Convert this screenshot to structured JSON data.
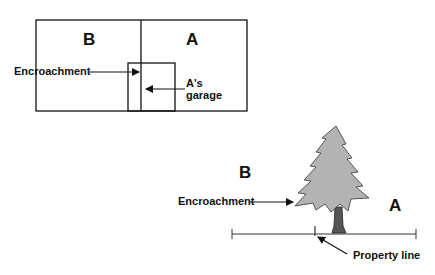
{
  "top_diagram": {
    "lot_b_label": "B",
    "lot_a_label": "A",
    "encroachment_label": "Encroachment",
    "garage_label_line1": "A's",
    "garage_label_line2": "garage"
  },
  "bottom_diagram": {
    "lot_b_label": "B",
    "lot_a_label": "A",
    "encroachment_label": "Encroachment",
    "property_line_label": "Property line"
  },
  "colors": {
    "tree_foliage": "#b3b3b3",
    "tree_trunk": "#555555",
    "line": "#111111"
  }
}
